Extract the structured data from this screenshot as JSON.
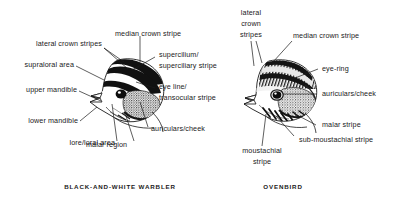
{
  "figure": {
    "background_color": "#ffffff",
    "ink_color": "#1a1a1a"
  },
  "panels": [
    {
      "id": "black-and-white-warbler",
      "caption": "BLACK-AND-WHITE WARBLER",
      "labels": [
        {
          "id": "lateral-crown-stripes",
          "text": "lateral crown stripes"
        },
        {
          "id": "supraloral-area",
          "text": "supraloral area"
        },
        {
          "id": "upper-mandible",
          "text": "upper mandible"
        },
        {
          "id": "lower-mandible",
          "text": "lower mandible"
        },
        {
          "id": "lore-loral-area",
          "text": "lore/loral area"
        },
        {
          "id": "median-crown-stripe",
          "text": "median crown stripe"
        },
        {
          "id": "supercilium-line1",
          "text": "supercilium/"
        },
        {
          "id": "supercilium-line2",
          "text": "superciliary stripe"
        },
        {
          "id": "eye-line-line1",
          "text": "eye line/"
        },
        {
          "id": "eye-line-line2",
          "text": "transocular stripe"
        },
        {
          "id": "auriculars-cheek",
          "text": "auriculars/cheek"
        },
        {
          "id": "malar-region",
          "text": "malar region"
        }
      ]
    },
    {
      "id": "ovenbird",
      "caption": "OVENBIRD",
      "labels": [
        {
          "id": "lateral-line1",
          "text": "lateral"
        },
        {
          "id": "lateral-line2",
          "text": "crown"
        },
        {
          "id": "lateral-line3",
          "text": "stripes"
        },
        {
          "id": "median-crown-stripe",
          "text": "median crown stripe"
        },
        {
          "id": "eye-ring",
          "text": "eye-ring"
        },
        {
          "id": "auriculars-cheek",
          "text": "auriculars/cheek"
        },
        {
          "id": "malar-stripe",
          "text": "malar stripe"
        },
        {
          "id": "sub-moustachial-stripe",
          "text": "sub-moustachial stripe"
        },
        {
          "id": "moustachial-line1",
          "text": "moustachial"
        },
        {
          "id": "moustachial-line2",
          "text": "stripe"
        }
      ]
    }
  ]
}
